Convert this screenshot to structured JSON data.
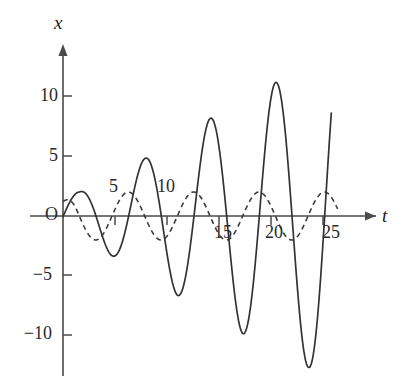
{
  "figure": {
    "title": "",
    "axis_labels": {
      "x": "x",
      "t": "t"
    },
    "origin_label": "O",
    "y_ticks": [
      {
        "value": 10,
        "label": "10"
      },
      {
        "value": 5,
        "label": "5"
      },
      {
        "value": -5,
        "label": "−5"
      },
      {
        "value": -10,
        "label": "−10"
      }
    ],
    "x_ticks": [
      {
        "value": 5,
        "label": "5"
      },
      {
        "value": 10,
        "label": "10"
      },
      {
        "value": 15,
        "label": "15"
      },
      {
        "value": 20,
        "label": "20"
      },
      {
        "value": 25,
        "label": "25"
      }
    ],
    "colors": {
      "axis": "#4a4a4a",
      "solid_curve": "#333333",
      "dashed_curve": "#3a3a3a",
      "background": "#ffffff",
      "text": "#222222"
    }
  },
  "chart_data": {
    "type": "line",
    "title": "",
    "xlabel": "t",
    "ylabel": "x",
    "xlim": [
      -0.6,
      27.5
    ],
    "ylim": [
      -14.5,
      15.5
    ],
    "grid": false,
    "legend": "none",
    "axis_arrows": {
      "x": true,
      "y": true
    },
    "x_tick_values": [
      5,
      10,
      15,
      20,
      25
    ],
    "y_tick_values": [
      10,
      5,
      -5,
      -10
    ],
    "series": [
      {
        "name": "resonant-solution",
        "style": "solid",
        "description": "growing-amplitude oscillation, amplitude increases roughly linearly with t",
        "formula": "x = 0.45*t*sin(t) + 2*sin(t)*0.1",
        "period": 6.283,
        "t_start": 0,
        "t_end": 25.8,
        "key_points": [
          {
            "t": 0.0,
            "x": 0.0
          },
          {
            "t": 1.6,
            "x": 2.0
          },
          {
            "t": 3.2,
            "x": 0.0
          },
          {
            "t": 4.7,
            "x": -3.3
          },
          {
            "t": 6.3,
            "x": 0.0
          },
          {
            "t": 7.9,
            "x": 4.8
          },
          {
            "t": 9.4,
            "x": 0.0
          },
          {
            "t": 11.0,
            "x": -6.6
          },
          {
            "t": 12.6,
            "x": 0.0
          },
          {
            "t": 14.1,
            "x": 8.1
          },
          {
            "t": 15.7,
            "x": 0.0
          },
          {
            "t": 17.3,
            "x": -9.8
          },
          {
            "t": 18.8,
            "x": 0.0
          },
          {
            "t": 20.4,
            "x": 11.1
          },
          {
            "t": 22.0,
            "x": 0.0
          },
          {
            "t": 23.6,
            "x": -12.6
          },
          {
            "t": 25.1,
            "x": 0.0
          },
          {
            "t": 25.8,
            "x": 14.4
          }
        ]
      },
      {
        "name": "steady-state-solution",
        "style": "dashed",
        "description": "constant-amplitude oscillation, amplitude about 2",
        "formula": "x = 2*sin(t + 0.4)",
        "amplitude": 2.0,
        "period": 6.283,
        "t_start": 0,
        "t_end": 26.4,
        "key_points": [
          {
            "t": 0.0,
            "x": 1.2
          },
          {
            "t": 1.2,
            "x": 2.0
          },
          {
            "t": 2.7,
            "x": 0.0
          },
          {
            "t": 4.3,
            "x": -2.0
          },
          {
            "t": 5.9,
            "x": 0.0
          },
          {
            "t": 7.5,
            "x": 2.0
          },
          {
            "t": 9.0,
            "x": 0.0
          },
          {
            "t": 10.6,
            "x": -2.0
          },
          {
            "t": 12.2,
            "x": 0.0
          },
          {
            "t": 13.8,
            "x": 2.0
          },
          {
            "t": 15.3,
            "x": 0.0
          },
          {
            "t": 16.9,
            "x": -2.0
          },
          {
            "t": 18.5,
            "x": 0.0
          },
          {
            "t": 20.1,
            "x": 2.0
          },
          {
            "t": 21.6,
            "x": 0.0
          },
          {
            "t": 23.2,
            "x": -2.0
          },
          {
            "t": 24.8,
            "x": 0.0
          },
          {
            "t": 26.4,
            "x": 2.0
          }
        ]
      }
    ]
  }
}
